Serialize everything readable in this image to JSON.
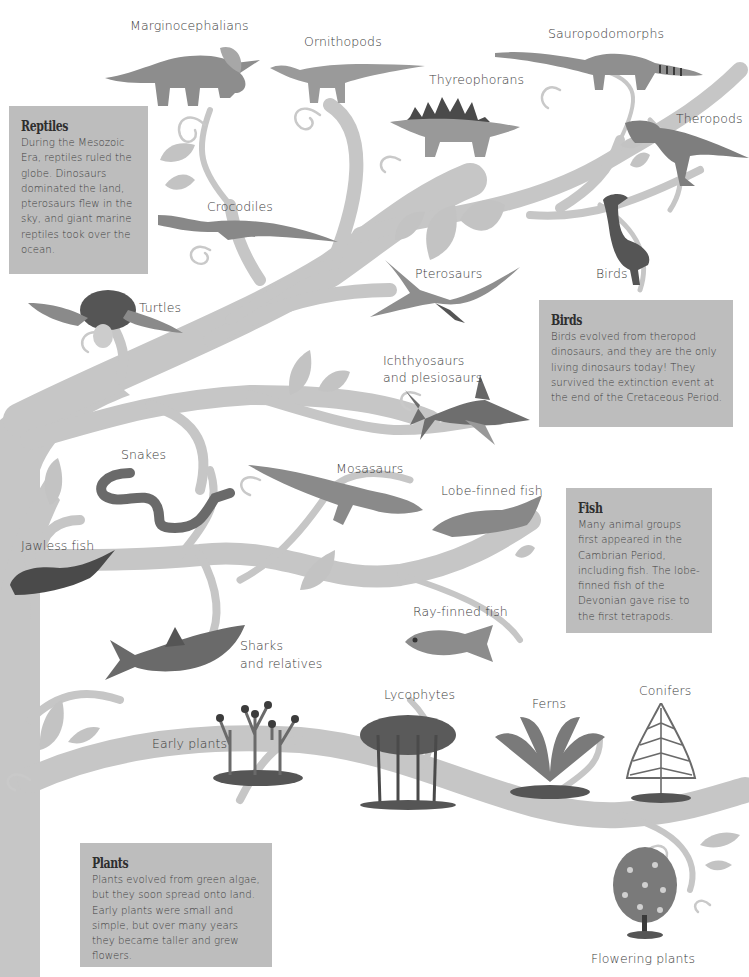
{
  "diagram": {
    "type": "evolutionary-tree",
    "colors": {
      "branch": "#c6c6c6",
      "leaf": "#c3c3c3",
      "info_box": "#bdbdbd",
      "label_text": "#3c3c3c"
    }
  },
  "labels": {
    "marginocephalians": "Marginocephalians",
    "ornithopods": "Ornithopods",
    "sauropodomorphs": "Sauropodomorphs",
    "thyreophorans": "Thyreophorans",
    "theropods": "Theropods",
    "crocodiles": "Crocodiles",
    "birds": "Birds",
    "pterosaurs": "Pterosaurs",
    "turtles": "Turtles",
    "ichthyosaurs_1": "Ichthyosaurs",
    "ichthyosaurs_2": "and plesiosaurs",
    "snakes": "Snakes",
    "mosasaurs": "Mosasaurs",
    "lobe_finned_fish": "Lobe-finned fish",
    "jawless_fish": "Jawless fish",
    "ray_finned_fish": "Ray-finned fish",
    "sharks_1": "Sharks",
    "sharks_2": "and relatives",
    "lycophytes": "Lycophytes",
    "ferns": "Ferns",
    "conifers": "Conifers",
    "early_plants": "Early plants",
    "flowering_plants": "Flowering plants"
  },
  "info_boxes": {
    "reptiles": {
      "title": "Reptiles",
      "text": "During the Mesozoic Era, reptiles ruled the globe. Dinosaurs dominated the land, pterosaurs flew in the sky, and giant marine reptiles took over the ocean."
    },
    "birds": {
      "title": "Birds",
      "text": "Birds evolved from theropod dinosaurs, and they are the only living dinosaurs today! They survived the extinction event at the end of the Cretaceous Period."
    },
    "fish": {
      "title": "Fish",
      "text": "Many animal groups first appeared in the Cambrian Period, including fish. The lobe-finned fish of the Devonian gave rise to the first tetrapods."
    },
    "plants": {
      "title": "Plants",
      "text": "Plants evolved from green algae, but they soon spread onto land. Early plants were small and simple, but over many years they became taller and grew flowers."
    }
  }
}
